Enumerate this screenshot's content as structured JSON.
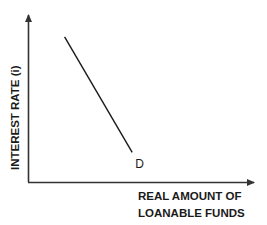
{
  "chart_data": {
    "type": "line",
    "title": "",
    "xlabel": "REAL AMOUNT OF LOANABLE FUNDS",
    "xlabel_lines": [
      "REAL AMOUNT OF",
      "LOANABLE FUNDS"
    ],
    "ylabel": "INTEREST RATE (i)",
    "grid": false,
    "legend": null,
    "xlim": [
      0,
      100
    ],
    "ylim": [
      0,
      100
    ],
    "series": [
      {
        "name": "D",
        "label": "D",
        "description": "Downward-sloping demand curve for loanable funds",
        "points": [
          {
            "x": 16,
            "y": 87
          },
          {
            "x": 46,
            "y": 18
          }
        ]
      }
    ],
    "annotations": [
      {
        "text": "D",
        "attached_to": "series.D",
        "position": "end"
      }
    ],
    "ticks": {
      "x": [],
      "y": []
    }
  },
  "colors": {
    "axis": "#333333",
    "curve": "#1a1a1a",
    "text": "#1a1a1a",
    "background": "#ffffff"
  }
}
